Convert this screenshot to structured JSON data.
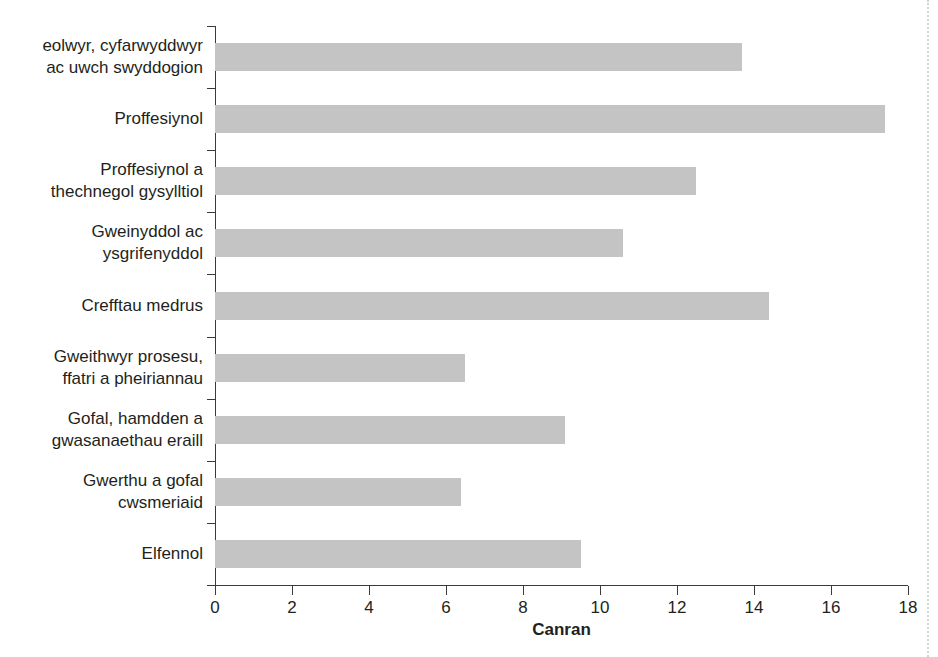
{
  "chart_data": {
    "type": "bar",
    "orientation": "horizontal",
    "title": "",
    "xlabel": "Canran",
    "ylabel": "",
    "xlim": [
      0,
      18
    ],
    "xticks": [
      0,
      2,
      4,
      6,
      8,
      10,
      12,
      14,
      16,
      18
    ],
    "xtick_labels": [
      "0",
      "2",
      "4",
      "6",
      "8",
      "10",
      "12",
      "14",
      "16",
      "18"
    ],
    "grid": false,
    "legend": null,
    "bar_color": "#c4c4c4",
    "axis_color": "#3a3a3a",
    "categories": [
      "eolwyr, cyfarwyddwyr\nac uwch swyddogion",
      "Proffesiynol",
      "Proffesiynol a\nthechnegol gysylltiol",
      "Gweinyddol ac\nysgrifenyddol",
      "Crefftau medrus",
      "Gweithwyr prosesu,\nffatri a pheiriannau",
      "Gofal, hamdden a\ngwasanaethau eraill",
      "Gwerthu a gofal\ncwsmeriaid",
      "Elfennol"
    ],
    "values": [
      13.7,
      17.4,
      12.5,
      10.6,
      14.4,
      6.5,
      9.1,
      6.4,
      9.5
    ]
  }
}
